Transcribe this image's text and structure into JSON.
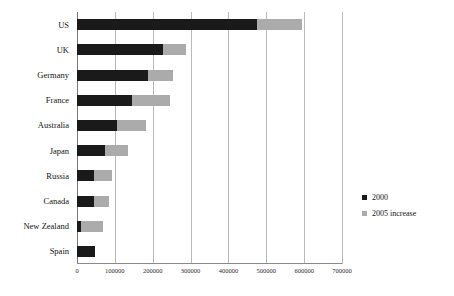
{
  "chart_data": {
    "type": "bar",
    "orientation": "horizontal",
    "stacked": true,
    "title": "",
    "xlabel": "",
    "ylabel": "",
    "xlim": [
      0,
      700000
    ],
    "xticks": [
      0,
      100000,
      200000,
      300000,
      400000,
      500000,
      600000,
      700000
    ],
    "xtick_labels": [
      "0",
      "100000",
      "200000",
      "300000",
      "400000",
      "500000",
      "600000",
      "700000"
    ],
    "grid": true,
    "legend_position": "right",
    "categories": [
      "US",
      "UK",
      "Germany",
      "France",
      "Australia",
      "Japan",
      "Russia",
      "Canada",
      "New Zealand",
      "Spain"
    ],
    "series": [
      {
        "name": "2000",
        "color": "#1a1a1a",
        "values": [
          475000,
          227000,
          187000,
          145000,
          106000,
          74000,
          44000,
          46000,
          11000,
          48000
        ]
      },
      {
        "name": "2005 increase",
        "color": "#ababab",
        "values": [
          120000,
          61000,
          67000,
          101000,
          76000,
          60000,
          48000,
          38000,
          59000,
          0
        ]
      }
    ],
    "totals": [
      595000,
      288000,
      254000,
      246000,
      182000,
      134000,
      92000,
      84000,
      70000,
      48000
    ]
  },
  "legend": {
    "items": [
      {
        "label": "2000",
        "swatch": "black-square-swatch",
        "color": "#1a1a1a"
      },
      {
        "label": "2005 increase",
        "swatch": "gray-square-swatch",
        "color": "#ababab"
      }
    ]
  }
}
